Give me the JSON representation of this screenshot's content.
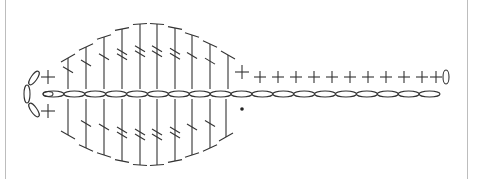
{
  "diagram": {
    "type": "crochet-stitch-chart",
    "colors": {
      "ink": "#333333",
      "border": "#bdbdbd",
      "background": "#ffffff"
    },
    "foundation_chain": {
      "count": 19,
      "y": 94,
      "x_start": 43,
      "x_end": 440
    },
    "top_row": {
      "start_sc": {
        "x": 48
      },
      "tall_stitches": [
        {
          "x": 68,
          "top": 58,
          "bars": 1
        },
        {
          "x": 86,
          "top": 47,
          "bars": 1
        },
        {
          "x": 104,
          "top": 37,
          "bars": 1
        },
        {
          "x": 122,
          "top": 29,
          "bars": 2
        },
        {
          "x": 140,
          "top": 24,
          "bars": 2
        },
        {
          "x": 157,
          "top": 24,
          "bars": 2
        },
        {
          "x": 175,
          "top": 28,
          "bars": 2
        },
        {
          "x": 192,
          "top": 35,
          "bars": 1
        },
        {
          "x": 210,
          "top": 44,
          "bars": 1
        },
        {
          "x": 228,
          "top": 55,
          "bars": 0
        }
      ],
      "single_crochets": [
        242,
        260,
        278,
        296,
        314,
        332,
        350,
        368,
        386,
        404,
        422,
        436
      ],
      "end_chain": {
        "x": 446,
        "y": 77
      }
    },
    "bottom_row": {
      "start_sc": {
        "x": 48
      },
      "tall_stitches": [
        {
          "x": 68,
          "bottom": 135,
          "bars": 0
        },
        {
          "x": 86,
          "bottom": 148,
          "bars": 1
        },
        {
          "x": 104,
          "bottom": 155,
          "bars": 1
        },
        {
          "x": 122,
          "bottom": 161,
          "bars": 2
        },
        {
          "x": 140,
          "bottom": 165,
          "bars": 2
        },
        {
          "x": 157,
          "bottom": 165,
          "bars": 2
        },
        {
          "x": 175,
          "bottom": 161,
          "bars": 2
        },
        {
          "x": 192,
          "bottom": 155,
          "bars": 1
        },
        {
          "x": 210,
          "bottom": 148,
          "bars": 1
        },
        {
          "x": 226,
          "bottom": 137,
          "bars": 0
        }
      ],
      "end_marker_dot": {
        "x": 242,
        "y": 109
      }
    },
    "turning_chain_left": {
      "x": 30,
      "y_top": 72,
      "y_bottom": 118
    }
  }
}
